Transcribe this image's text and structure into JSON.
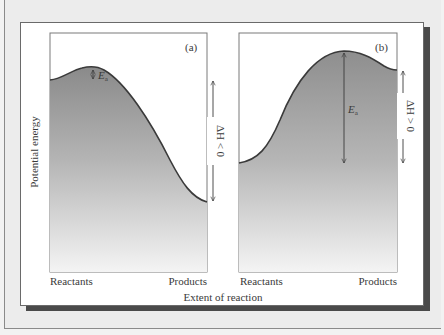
{
  "figure": {
    "x_axis_title": "Extent of reaction",
    "y_axis_title": "Potential energy",
    "panels": [
      {
        "id": "a",
        "tag": "(a)",
        "x_start_label": "Reactants",
        "x_end_label": "Products",
        "activation_label": "E",
        "activation_subscript": "a",
        "enthalpy_label": "ΔH < 0",
        "reaction_type": "exothermic"
      },
      {
        "id": "b",
        "tag": "(b)",
        "x_start_label": "Reactants",
        "x_end_label": "Products",
        "activation_label": "E",
        "activation_subscript": "a",
        "enthalpy_label": "ΔH > 0",
        "reaction_type": "endothermic"
      }
    ]
  },
  "colors": {
    "background": "#ececec",
    "card": "#ffffff",
    "shadow": "#4a4a4a",
    "curve": "#3a3a3a",
    "fill_top": "#8e8e8e",
    "fill_bottom": "#f4f4f4"
  }
}
